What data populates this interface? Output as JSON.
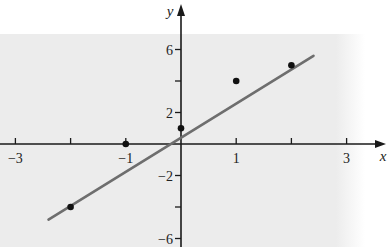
{
  "chart_data": {
    "type": "scatter",
    "title": "",
    "xlabel": "x",
    "ylabel": "y",
    "xlim": [
      -3.3,
      3.7
    ],
    "ylim": [
      -6.5,
      7.5
    ],
    "grid": false,
    "legend": null,
    "x_ticks": [
      -3,
      -2,
      -1,
      1,
      2,
      3
    ],
    "x_tick_labels": [
      "-3",
      "",
      "-1",
      "1",
      "",
      "3"
    ],
    "y_ticks": [
      -6,
      -4,
      -2,
      2,
      4,
      6
    ],
    "y_tick_labels": [
      "-6",
      "",
      "-2",
      "2",
      "",
      "6"
    ],
    "series": [
      {
        "name": "data points",
        "kind": "scatter",
        "x": [
          -2,
          -1,
          0,
          1,
          2
        ],
        "y": [
          -4,
          0,
          1,
          4,
          5
        ]
      },
      {
        "name": "regression line",
        "kind": "line",
        "x": [
          -2.4,
          2.4
        ],
        "y": [
          -4.8,
          5.6
        ]
      }
    ],
    "colors": {
      "background_panel": "#ececec",
      "axis": "#1a1a1a",
      "line": "#6e6e6e",
      "points": "#111111"
    }
  }
}
